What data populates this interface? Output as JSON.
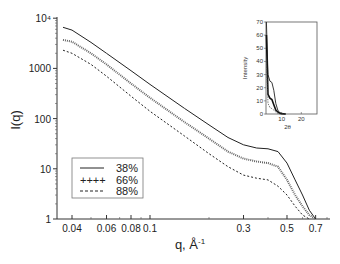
{
  "chart_data": {
    "type": "line",
    "title": "",
    "xlabel": "q, Å⁻¹",
    "ylabel": "I(q)",
    "xscale": "log",
    "yscale": "log",
    "xlim": [
      0.035,
      0.8
    ],
    "ylim": [
      1,
      10000
    ],
    "x_ticks": [
      {
        "value": 0.04,
        "label": "0.04"
      },
      {
        "value": 0.06,
        "label": "0.06"
      },
      {
        "value": 0.08,
        "label": "0.08"
      },
      {
        "value": 0.1,
        "label": "0.1"
      },
      {
        "value": 0.3,
        "label": "0.3"
      },
      {
        "value": 0.5,
        "label": "0.5"
      },
      {
        "value": 0.7,
        "label": "0.7"
      }
    ],
    "y_ticks": [
      {
        "value": 1,
        "label": "1"
      },
      {
        "value": 10,
        "label": "10"
      },
      {
        "value": 100,
        "label": "100"
      },
      {
        "value": 1000,
        "label": "1000"
      },
      {
        "value": 10000,
        "label": "10⁴"
      }
    ],
    "grid": false,
    "legend_position": "lower-left",
    "series": [
      {
        "name": "38%",
        "style": "solid",
        "x": [
          0.036,
          0.04,
          0.05,
          0.06,
          0.08,
          0.1,
          0.15,
          0.2,
          0.25,
          0.3,
          0.35,
          0.4,
          0.45,
          0.5,
          0.55,
          0.6,
          0.65,
          0.7
        ],
        "y": [
          6600,
          5800,
          3300,
          2000,
          900,
          480,
          160,
          75,
          42,
          30,
          26,
          25,
          22,
          13,
          6,
          3,
          1.5,
          1
        ]
      },
      {
        "name": "66%",
        "style": "plus-markers",
        "x": [
          0.036,
          0.04,
          0.05,
          0.06,
          0.08,
          0.1,
          0.15,
          0.2,
          0.25,
          0.3,
          0.35,
          0.4,
          0.45,
          0.5,
          0.55,
          0.6,
          0.65,
          0.7
        ],
        "y": [
          3700,
          3400,
          2000,
          1200,
          500,
          260,
          85,
          40,
          22,
          16,
          14,
          13,
          11,
          6,
          3,
          1.8,
          1.2,
          1
        ]
      },
      {
        "name": "88%",
        "style": "dashed",
        "x": [
          0.036,
          0.04,
          0.05,
          0.06,
          0.08,
          0.1,
          0.15,
          0.2,
          0.25,
          0.3,
          0.35,
          0.4,
          0.45,
          0.5,
          0.55,
          0.6,
          0.65
        ],
        "y": [
          2300,
          2000,
          1200,
          700,
          280,
          140,
          45,
          20,
          11,
          7.5,
          6.5,
          6,
          4.5,
          3,
          1.8,
          1.2,
          1
        ]
      }
    ],
    "inset": {
      "type": "line",
      "xlabel": "2θ",
      "ylabel": "Intensity",
      "xlim": [
        2,
        28
      ],
      "ylim": [
        0,
        70
      ],
      "x_ticks": [
        {
          "value": 10,
          "label": "10"
        },
        {
          "value": 20,
          "label": "20"
        }
      ],
      "y_ticks": [
        {
          "value": 0,
          "label": "0"
        },
        {
          "value": 10,
          "label": "10"
        },
        {
          "value": 20,
          "label": "20"
        },
        {
          "value": 30,
          "label": "30"
        },
        {
          "value": 40,
          "label": "40"
        },
        {
          "value": 50,
          "label": "50"
        },
        {
          "value": 60,
          "label": "60"
        },
        {
          "value": 70,
          "label": "70"
        }
      ],
      "series": [
        {
          "name": "38%",
          "x": [
            2.2,
            3,
            4,
            5,
            6,
            7,
            8,
            9,
            10,
            12
          ],
          "y": [
            70,
            30,
            25,
            24,
            18,
            8,
            3,
            1,
            0.5,
            0
          ]
        },
        {
          "name": "66%",
          "x": [
            2.2,
            3,
            4,
            5,
            6,
            7,
            8,
            9,
            10,
            12
          ],
          "y": [
            60,
            15,
            12,
            11,
            7,
            3,
            1.5,
            0.5,
            0.2,
            0
          ]
        },
        {
          "name": "88%",
          "x": [
            2.2,
            3,
            4,
            5,
            6,
            7,
            8,
            9,
            10,
            12
          ],
          "y": [
            40,
            8,
            5,
            4,
            3,
            1.5,
            0.5,
            0.2,
            0,
            0
          ]
        }
      ]
    }
  },
  "legend": {
    "items": [
      {
        "symbol": "——",
        "label": "38%"
      },
      {
        "symbol": "++++",
        "label": "66%"
      },
      {
        "symbol": "- - - -",
        "label": "88%"
      }
    ]
  },
  "axes": {
    "xlabel_main": "q, Å",
    "xlabel_sup": "-1",
    "ylabel": "I(q)",
    "inset_xlabel": "2θ",
    "inset_ylabel": "Intensity"
  }
}
